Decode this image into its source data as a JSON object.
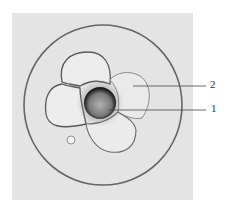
{
  "figure": {
    "type": "micrograph",
    "labels": [
      {
        "id": "1",
        "text": "1",
        "target": "central dark body"
      },
      {
        "id": "2",
        "text": "2",
        "target": "blastomere"
      }
    ],
    "colors": {
      "background": "#e6e6e6",
      "outline": "#555555",
      "center_dark": "#2a2a2a",
      "center_core": "#9a9a9a",
      "leader_line": "#444444"
    }
  }
}
